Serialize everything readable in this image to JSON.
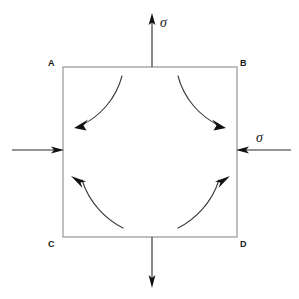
{
  "diagram": {
    "background_color": "#ffffff",
    "outline_color": "#8c8c8c",
    "arrow_color": "#111111",
    "curve_color": "#3a3a3a"
  },
  "element": {
    "corner_labels": {
      "top_left": "A",
      "top_right": "B",
      "bottom_left": "C",
      "bottom_right": "D"
    }
  },
  "loads": {
    "top": {
      "name": "top-tension-arrow",
      "label": "σ",
      "direction": "up",
      "has_label": true
    },
    "bottom": {
      "name": "bottom-tension-arrow",
      "label": "",
      "direction": "down",
      "has_label": false
    },
    "right": {
      "name": "right-compression-arrow",
      "label": "σ",
      "direction": "left",
      "has_label": true
    },
    "left": {
      "name": "left-compression-arrow",
      "label": "",
      "direction": "right",
      "has_label": false
    }
  },
  "curved_arrows": [
    {
      "name": "curve-top-left",
      "direction": "down-left"
    },
    {
      "name": "curve-top-right",
      "direction": "down-right"
    },
    {
      "name": "curve-bottom-left",
      "direction": "up-left"
    },
    {
      "name": "curve-bottom-right",
      "direction": "up-right"
    }
  ]
}
